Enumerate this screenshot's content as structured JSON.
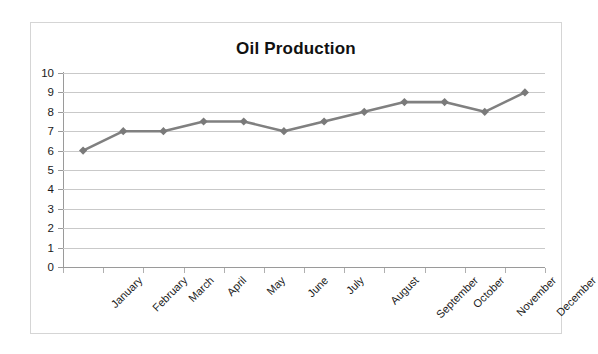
{
  "chart_data": {
    "type": "line",
    "title": "Oil Production",
    "xlabel": "",
    "ylabel": "",
    "categories": [
      "January",
      "February",
      "March",
      "April",
      "May",
      "June",
      "July",
      "August",
      "September",
      "October",
      "November",
      "December"
    ],
    "values": [
      6,
      7,
      7,
      7.5,
      7.5,
      7,
      7.5,
      8,
      8.5,
      8.5,
      8,
      9
    ],
    "series": [
      {
        "name": "Oil Production",
        "values": [
          6,
          7,
          7,
          7.5,
          7.5,
          7,
          7.5,
          8,
          8.5,
          8.5,
          8,
          9
        ]
      }
    ],
    "ylim": [
      0,
      10
    ],
    "y_ticks": [
      0,
      1,
      2,
      3,
      4,
      5,
      6,
      7,
      8,
      9,
      10
    ],
    "y_tick_labels": [
      "0",
      "1",
      "2",
      "3",
      "4",
      "5",
      "6",
      "7",
      "8",
      "9",
      "10"
    ],
    "grid": true,
    "legend": false,
    "legend_position": "none",
    "marker": "diamond",
    "line_color": "#808080",
    "marker_color": "#7a7a7a",
    "gridline_color": "#c9c9c9",
    "axis_color": "#9a9a9a",
    "border_color": "#d5d5d5",
    "background_color": "#ffffff",
    "text_color": "#1a1a1a",
    "x_label_rotation": -45
  }
}
